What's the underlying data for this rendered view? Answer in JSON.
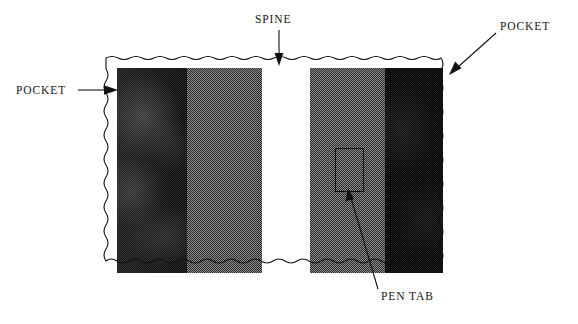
{
  "figure": {
    "type": "technical-illustration",
    "background_color": "#ffffff",
    "ink_color": "#111111"
  },
  "labels": {
    "spine": "SPINE",
    "pocket_left": "POCKET",
    "pocket_right": "POCKET",
    "pen_tab": "PEN TAB"
  },
  "photo": {
    "border_style": "wavy deckled edge",
    "bands": [
      {
        "name": "left-pocket-panel",
        "fill": "dark-blotchy",
        "color": "#101010",
        "x": 0,
        "width": 70
      },
      {
        "name": "left-gray-panel",
        "fill": "halftone-50",
        "color": "#8c8c8c",
        "x": 70,
        "width": 75
      },
      {
        "name": "spine-panel",
        "fill": "white",
        "color": "#ffffff",
        "x": 145,
        "width": 48
      },
      {
        "name": "right-gray-panel",
        "fill": "halftone-50",
        "color": "#8c8c8c",
        "x": 193,
        "width": 75
      },
      {
        "name": "right-pocket-panel",
        "fill": "near-black",
        "color": "#050505",
        "x": 268,
        "width": 58
      }
    ],
    "pen_tab_rect": {
      "x": 218,
      "y": 80,
      "width": 27,
      "height": 42,
      "stroke": "#111111"
    }
  },
  "leaders": [
    {
      "name": "spine-arrow",
      "style": "vertical-arrow-down",
      "from": "SPINE label",
      "to": "top edge of photo"
    },
    {
      "name": "pocket-left-arrow",
      "style": "horizontal-arrow-right",
      "from": "POCKET label",
      "to": "left edge of photo"
    },
    {
      "name": "pocket-right-arrow",
      "style": "diagonal-arrow-down-left",
      "from": "POCKET label",
      "to": "top-right corner of photo"
    },
    {
      "name": "pen-tab-arrow",
      "style": "diagonal-arrow-up-left",
      "from": "PEN TAB label",
      "to": "pen tab rectangle"
    }
  ]
}
